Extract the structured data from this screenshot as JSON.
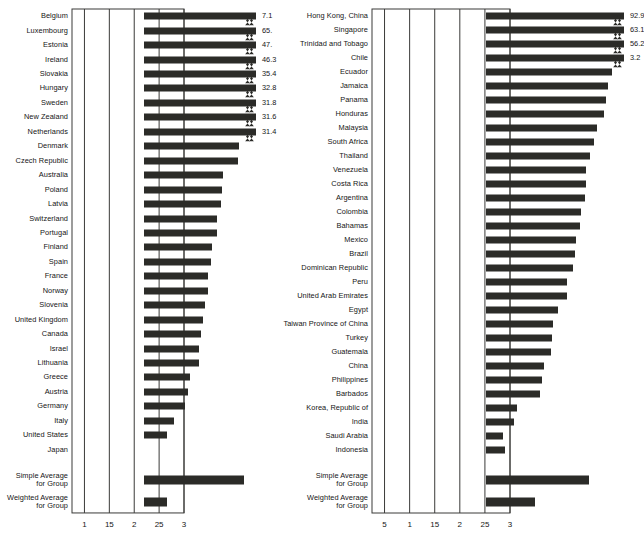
{
  "chart_data": [
    {
      "type": "bar",
      "orientation": "horizontal",
      "panel": "left",
      "title": "",
      "xlabel": "",
      "ylabel": "",
      "grid": true,
      "legend": "none",
      "xlim": [
        0,
        3
      ],
      "xticks": [
        1,
        15,
        2,
        25,
        3
      ],
      "xtick_labels": [
        "1",
        "15",
        "2",
        "25",
        "3"
      ],
      "categories": [
        "Belgium",
        "Luxembourg",
        "Estonia",
        "Ireland",
        "Slovakia",
        "Hungary",
        "Sweden",
        "New Zealand",
        "Netherlands",
        "Denmark",
        "Czech Republic",
        "Australia",
        "Poland",
        "Latvia",
        "Switzerland",
        "Portugal",
        "Finland",
        "Spain",
        "France",
        "Norway",
        "Slovenia",
        "United Kingdom",
        "Canada",
        "Israel",
        "Lithuania",
        "Greece",
        "Austria",
        "Germany",
        "Italy",
        "United States",
        "Japan"
      ],
      "values": [
        3.0,
        3.0,
        3.0,
        3.0,
        3.0,
        3.0,
        3.0,
        3.0,
        3.0,
        2.66,
        2.64,
        2.34,
        2.32,
        2.3,
        2.22,
        2.22,
        2.12,
        2.1,
        2.04,
        2.04,
        1.98,
        1.94,
        1.89,
        1.86,
        1.85,
        1.67,
        1.63,
        1.57,
        1.36,
        1.21,
        0.54
      ],
      "clipped": [
        true,
        true,
        true,
        true,
        true,
        true,
        true,
        true,
        true,
        false,
        false,
        false,
        false,
        false,
        false,
        false,
        false,
        false,
        false,
        false,
        false,
        false,
        false,
        false,
        false,
        false,
        false,
        false,
        false,
        false,
        false
      ],
      "data_labels": [
        "7.1",
        "65.",
        "47.",
        "46.3",
        "35.4",
        "32.8",
        "31.8",
        "31.6",
        "31.4",
        "",
        "",
        "",
        "",
        "",
        "",
        "",
        "",
        "",
        "",
        "",
        "",
        "",
        "",
        "",
        "",
        "",
        "",
        "",
        "",
        "",
        ""
      ],
      "summary": [
        {
          "label": "Simple Average\nfor Group",
          "value": 2.76
        },
        {
          "label": "Weighted Average\nfor Group",
          "value": 1.22
        }
      ]
    },
    {
      "type": "bar",
      "orientation": "horizontal",
      "panel": "right",
      "title": "",
      "xlabel": "",
      "ylabel": "",
      "grid": true,
      "legend": "none",
      "xlim": [
        0,
        3
      ],
      "xticks": [
        5,
        1,
        15,
        2,
        25,
        3
      ],
      "xtick_labels": [
        "5",
        "1",
        "15",
        "2",
        "25",
        "3"
      ],
      "categories": [
        "Hong Kong, China",
        "Singapore",
        "Trinidad and Tobago",
        "Chile",
        "Ecuador",
        "Jamaica",
        "Panama",
        "Honduras",
        "Malaysia",
        "South Africa",
        "Thailand",
        "Venezuela",
        "Costa Rica",
        "Argentina",
        "Colombia",
        "Bahamas",
        "Mexico",
        "Brazil",
        "Dominican Republic",
        "Peru",
        "United Arab Emirates",
        "Egypt",
        "Taiwan Province of China",
        "Turkey",
        "Guatemala",
        "China",
        "Philippines",
        "Barbados",
        "Korea, Republic of",
        "India",
        "Saudi Arabia",
        "Indonesia"
      ],
      "values": [
        3.0,
        3.0,
        3.0,
        3.0,
        2.77,
        2.68,
        2.64,
        2.6,
        2.46,
        2.4,
        2.32,
        2.24,
        2.24,
        2.23,
        2.14,
        2.13,
        2.05,
        2.02,
        1.99,
        1.87,
        1.86,
        1.69,
        1.58,
        1.56,
        1.55,
        1.4,
        1.37,
        1.33,
        0.86,
        0.81,
        0.59,
        0.62
      ],
      "clipped": [
        true,
        true,
        true,
        true,
        false,
        false,
        false,
        false,
        false,
        false,
        false,
        false,
        false,
        false,
        false,
        false,
        false,
        false,
        false,
        false,
        false,
        false,
        false,
        false,
        false,
        false,
        false,
        false,
        false,
        false,
        false,
        false
      ],
      "data_labels": [
        "92.9",
        "63.1",
        "56.2",
        "3.2",
        "",
        "",
        "",
        "",
        "",
        "",
        "",
        "",
        "",
        "",
        "",
        "",
        "",
        "",
        "",
        "",
        "",
        "",
        "",
        "",
        "",
        "",
        "",
        "",
        "",
        "",
        "",
        ""
      ],
      "summary": [
        {
          "label": "Simple Average\nfor Group",
          "value": 2.3
        },
        {
          "label": "Weighted Average\nfor Group",
          "value": 1.22
        }
      ]
    }
  ]
}
